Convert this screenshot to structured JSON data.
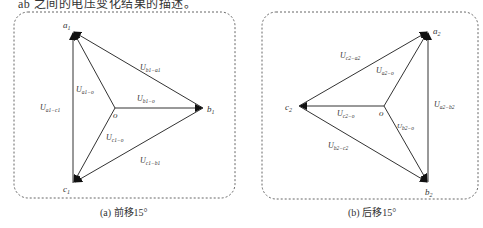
{
  "top_text": "ab 之间的电压变化结果的描述。",
  "panels": [
    {
      "id": "a",
      "caption": "(a) 前移15°",
      "vertices": {
        "a": "a1",
        "b": "b1",
        "c": "c1",
        "o": "o"
      },
      "labels": {
        "Uab": "U_b1-a1",
        "Uao": "U_a1-o",
        "Ubo": "U_b1-o",
        "Uac": "U_a1-c1",
        "Uco": "U_c1-o",
        "Ucb": "U_c1-b1"
      }
    },
    {
      "id": "b",
      "caption": "(b) 后移15°",
      "vertices": {
        "a": "a2",
        "b": "b2",
        "c": "c2",
        "o": "o"
      },
      "labels": {
        "Uca": "U_c2-a2",
        "Uao": "U_a2-o",
        "Uab": "U_a2-b2",
        "Uco": "U_c2-o",
        "Ubo": "U_b2-o",
        "Ubc": "U_b2-c2"
      }
    }
  ]
}
